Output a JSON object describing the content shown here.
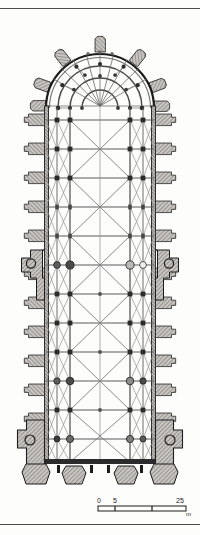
{
  "figure": {
    "kind": "architectural-floor-plan",
    "orientation": "apse at top, west front at bottom",
    "style": "engraved line drawing with hatched masonry"
  },
  "scale_bar": {
    "name": "graphic-scale",
    "unit": "m",
    "unit_label": "m",
    "ticks": [
      {
        "label": "0",
        "value": 0
      },
      {
        "label": "5",
        "value": 5
      },
      {
        "label": "25",
        "value": 25
      }
    ],
    "min_label": "0",
    "mid_label": "5",
    "max_label": "25"
  },
  "colors": {
    "paper": "#fdfdfc",
    "ink": "#1c1c1c",
    "rib_line": "#555555",
    "wall_fill": "#9a9a9a",
    "pier_fill": "#3a3a3a",
    "hatch": "#7d7d7d",
    "rule": "#2b2b2b"
  },
  "plan": {
    "apse": {
      "name": "apse-chevet",
      "description": "semicircular chevet with ambulatory and radiating ribs",
      "radiating_buttress_count": 7,
      "ambulatory_rings": 3
    },
    "nave": {
      "name": "nave",
      "description": "long rectangular nave with double aisles and quadripartite rib vaults",
      "bay_columns": 5,
      "bay_rows": 12
    },
    "crossing": {
      "name": "crossing-transept",
      "description": "crossing marked by heavy lateral buttress masses"
    },
    "west_front": {
      "name": "west-front",
      "description": "west facade with corner tower masses and three portal buttresses",
      "portal_count": 3,
      "tower_count": 2
    },
    "lateral_buttresses": {
      "name": "lateral-buttresses",
      "left_count": 11,
      "right_count": 11
    }
  }
}
